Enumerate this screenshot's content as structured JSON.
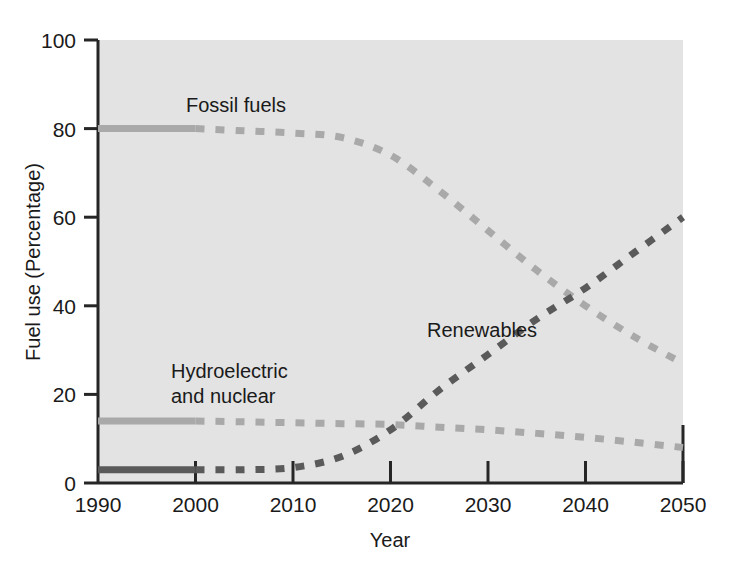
{
  "chart_data": {
    "type": "line",
    "title": "",
    "subtitle": "",
    "xlabel": "Year",
    "ylabel": "Fuel use (Percentage)",
    "xlim": [
      1990,
      2050
    ],
    "ylim": [
      0,
      100
    ],
    "xticks": [
      "1990",
      "2000",
      "2010",
      "2020",
      "2030",
      "2040",
      "2050"
    ],
    "yticks": [
      "0",
      "20",
      "40",
      "60",
      "80",
      "100"
    ],
    "grid": false,
    "legend_position": "inline-annotations",
    "x": [
      1990,
      1995,
      2000,
      2005,
      2010,
      2015,
      2020,
      2025,
      2030,
      2035,
      2040,
      2045,
      2050
    ],
    "series": [
      {
        "name": "Fossil fuels",
        "label": "Fossil fuels",
        "color": "#a9a9a9",
        "solid_until": 2000,
        "values": [
          80,
          80,
          80,
          79.5,
          79,
          78,
          74,
          66,
          57,
          48,
          40,
          33,
          27
        ]
      },
      {
        "name": "Renewables",
        "label": "Renewables",
        "color": "#5a5a5a",
        "solid_until": 2000,
        "values": [
          3,
          3,
          3,
          3,
          3.5,
          6,
          12,
          21,
          29,
          37,
          44,
          52,
          60
        ]
      },
      {
        "name": "Hydroelectric and nuclear",
        "label": "Hydroelectric\nand nuclear",
        "label_line1": "Hydroelectric",
        "label_line2": "and nuclear",
        "color": "#a9a9a9",
        "solid_until": 2000,
        "values": [
          14,
          14,
          14,
          13.8,
          13.6,
          13.4,
          13.2,
          12.6,
          12,
          11.2,
          10.3,
          9.2,
          8
        ]
      }
    ],
    "annotations": [
      {
        "text": "Fossil fuels",
        "x": 2002,
        "y": 88
      },
      {
        "text": "Renewables",
        "x": 2022,
        "y": 33
      },
      {
        "text": "Hydroelectric",
        "x": 1997,
        "y": 24
      },
      {
        "text": "and nuclear",
        "x": 1997,
        "y": 19
      }
    ],
    "colors": {
      "plot_background": "#e3e3e3",
      "axis": "#262626",
      "light_series": "#a9a9a9",
      "dark_series": "#5a5a5a",
      "page_background": "#ffffff"
    }
  }
}
